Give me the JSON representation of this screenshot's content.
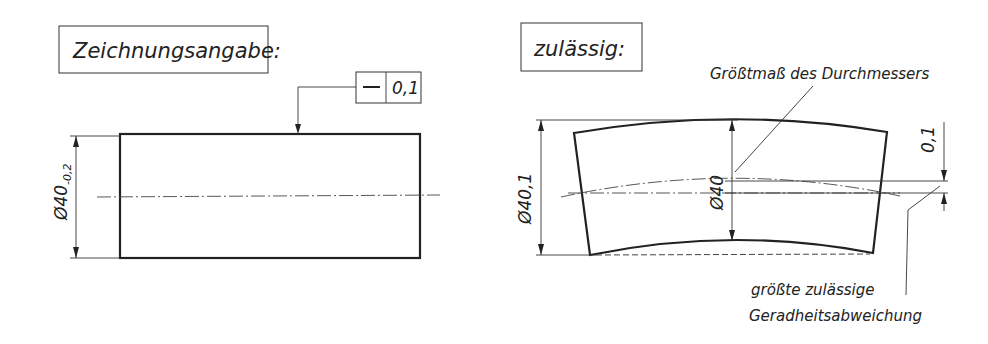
{
  "left_panel": {
    "title": "Zeichnungsangabe:",
    "tolerance_frame": {
      "symbol": "—",
      "symbol_meaning": "straightness",
      "value": "0,1"
    },
    "diameter_dimension": {
      "symbol": "Ø",
      "nominal": "40",
      "tolerance": "-0,2"
    }
  },
  "right_panel": {
    "title": "zulässig:",
    "annotation_top": "Größtmaß des Durchmessers",
    "outer_diameter_dimension": {
      "symbol": "Ø",
      "value": "40,1"
    },
    "inner_diameter_dimension": {
      "symbol": "Ø",
      "value": "40"
    },
    "deviation_dimension": "0,1",
    "annotation_bottom_line1": "größte zulässige",
    "annotation_bottom_line2": "Geradheitsabweichung"
  },
  "colors": {
    "line": "#222222",
    "background": "#ffffff"
  }
}
